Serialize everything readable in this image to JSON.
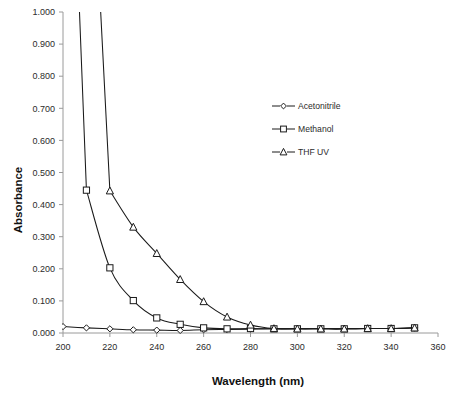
{
  "chart_data": {
    "type": "line",
    "title": "",
    "xlabel": "Wavelength (nm)",
    "ylabel": "Absorbance",
    "xlim": [
      200,
      360
    ],
    "ylim": [
      0.0,
      1.0
    ],
    "xticks": [
      200,
      220,
      240,
      260,
      280,
      300,
      320,
      340,
      360
    ],
    "xtick_labels": [
      "200",
      "220",
      "240",
      "260",
      "280",
      "300",
      "320",
      "340",
      "360"
    ],
    "yticks": [
      0.0,
      0.1,
      0.2,
      0.3,
      0.4,
      0.5,
      0.6,
      0.7,
      0.8,
      0.9,
      1.0
    ],
    "ytick_labels": [
      "0.000",
      "0.100",
      "0.200",
      "0.300",
      "0.400",
      "0.500",
      "0.600",
      "0.700",
      "0.800",
      "0.900",
      "1.000"
    ],
    "grid": false,
    "legend_position": "upper-right-inside",
    "x": [
      200,
      210,
      220,
      230,
      240,
      250,
      260,
      270,
      280,
      290,
      300,
      310,
      320,
      330,
      340,
      350
    ],
    "series": [
      {
        "name": "Acetonitrile",
        "marker": "diamond",
        "values": [
          0.02,
          0.016,
          0.013,
          0.01,
          0.009,
          0.008,
          0.01,
          0.011,
          0.012,
          0.013,
          0.013,
          0.013,
          0.013,
          0.014,
          0.014,
          0.016
        ]
      },
      {
        "name": "Methanol",
        "marker": "square",
        "values": [
          null,
          0.445,
          0.203,
          0.101,
          0.047,
          0.027,
          0.016,
          0.013,
          0.014,
          0.013,
          0.013,
          0.013,
          0.013,
          0.014,
          0.014,
          0.016
        ]
      },
      {
        "name": "THF UV",
        "marker": "triangle",
        "values": [
          null,
          null,
          0.443,
          0.33,
          0.248,
          0.167,
          0.098,
          0.05,
          0.025,
          0.014,
          0.013,
          0.013,
          0.013,
          0.014,
          0.014,
          0.016
        ]
      }
    ],
    "offscale_notes": [
      {
        "series": "Methanol",
        "x": 200,
        "note": "above 1.000, clipped at plot top"
      },
      {
        "series": "THF UV",
        "x": 210,
        "note": "above 1.000, clipped at plot top"
      }
    ]
  },
  "legend": {
    "entries": [
      {
        "label": "Acetonitrile",
        "marker": "diamond"
      },
      {
        "label": "Methanol",
        "marker": "square"
      },
      {
        "label": "THF UV",
        "marker": "triangle"
      }
    ]
  },
  "colors": {
    "line": "#1a1a1a",
    "axis": "#9a9a9a",
    "text": "#2b2b2b",
    "background": "#ffffff"
  }
}
